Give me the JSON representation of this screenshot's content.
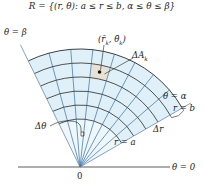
{
  "title": "R = {(r, θ): a ≤ r ≤ b, α ≤ θ ≤ β}",
  "labels": {
    "theta_beta": "θ = β",
    "theta_alpha": "θ = α",
    "theta_zero": "θ = 0",
    "r_b": "r = b",
    "r_a": "r = a",
    "delta_r": "Δr",
    "delta_theta": "Δθ",
    "delta_A": "ΔA",
    "delta_A_sub": "k",
    "sample_point": "(r̄",
    "sample_point_sub1": "k",
    "sample_point_mid": ", θ̄",
    "sample_point_sub2": "k",
    "sample_point_end": ")",
    "origin": "0"
  },
  "colors": {
    "region_fill": "#dff0f8",
    "cell_fill": "#e8e2d4",
    "grid_arc": "#2a2a2a",
    "grid_ray": "#3a6fa0",
    "boundary_ray": "#6a8cb0",
    "axis": "#333333"
  },
  "geometry": {
    "origin": [
      80,
      167
    ],
    "alpha_deg": 30,
    "beta_deg": 116,
    "radii": [
      48,
      62,
      76,
      90,
      104,
      118
    ],
    "ray_count": 9
  }
}
